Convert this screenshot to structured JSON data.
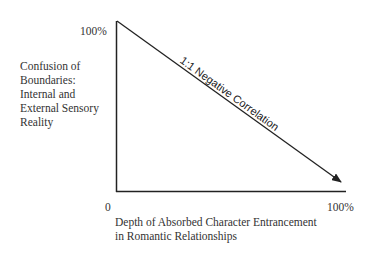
{
  "diagram": {
    "y_axis": {
      "label_lines": [
        "Confusion of",
        "Boundaries:",
        "Internal and",
        "External Sensory",
        "Reality"
      ],
      "max_label": "100%"
    },
    "x_axis": {
      "label_lines": [
        "Depth of Absorbed Character Entrancement",
        "in Romantic Relationships"
      ],
      "min_label": "0",
      "max_label": "100%"
    },
    "line_label": "1:1 Negative Correlation",
    "colors": {
      "line": "#222222",
      "text": "#333333",
      "background": "#ffffff"
    }
  }
}
